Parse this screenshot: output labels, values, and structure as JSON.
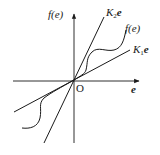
{
  "diagram": {
    "type": "nonlinearity-sector-bound",
    "labels": {
      "y_axis": "f(e)",
      "x_axis": "e",
      "origin": "O",
      "upper_line": {
        "coef": "K",
        "sub": "2",
        "var": "e"
      },
      "lower_line": {
        "coef": "K",
        "sub": "1",
        "var": "e"
      },
      "curve": "f(e)"
    },
    "colors": {
      "stroke": "#1a1a1a",
      "background": "#ffffff"
    }
  }
}
